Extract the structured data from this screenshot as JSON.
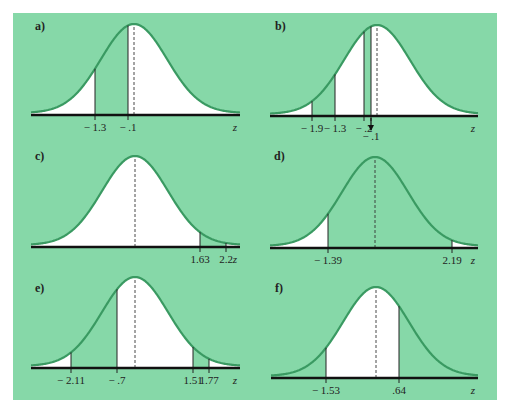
{
  "figure": {
    "background": "#86d8a8",
    "curve_color": "#3a9a62",
    "unshaded_color": "#ffffff",
    "axis_color": "#111111",
    "axis_variable": "z"
  },
  "chart_data": [
    {
      "type": "area",
      "label": "a)",
      "title": "Standard normal curve a)",
      "markers": [
        {
          "z": -1.3,
          "label": "− 1.3",
          "x": 95
        },
        {
          "z": -0.1,
          "label": "− .1",
          "x": 128
        }
      ],
      "green_regions": [
        [
          -1.3,
          -0.1
        ]
      ],
      "mean_x": 134,
      "axis_y": 115,
      "x_left": 31,
      "x_right": 240,
      "label_pos": [
        35,
        30
      ],
      "xlabel": "z"
    },
    {
      "type": "area",
      "label": "b)",
      "title": "Standard normal curve b)",
      "markers": [
        {
          "z": -1.9,
          "label": "− 1.9",
          "x": 312
        },
        {
          "z": -1.3,
          "label": "− 1.3",
          "x": 335
        },
        {
          "z": -0.2,
          "label": "− .2",
          "x": 364
        },
        {
          "z": -0.1,
          "label": "− .1",
          "x": 371,
          "arrow": true
        }
      ],
      "green_regions": [
        [
          -1.9,
          -1.3
        ],
        [
          -0.2,
          -0.1
        ]
      ],
      "mean_x": 377,
      "axis_y": 116,
      "x_left": 270,
      "x_right": 478,
      "label_pos": [
        275,
        30
      ],
      "xlabel": "z"
    },
    {
      "type": "area",
      "label": "c)",
      "title": "Standard normal curve c)",
      "markers": [
        {
          "z": 1.63,
          "label": "1.63",
          "x": 200
        },
        {
          "z": 2.2,
          "label": "2.2",
          "x": 226
        }
      ],
      "green_regions": [
        [
          1.63,
          2.2
        ]
      ],
      "mean_x": 135,
      "axis_y": 247,
      "x_left": 31,
      "x_right": 240,
      "label_pos": [
        35,
        160
      ],
      "xlabel": "z"
    },
    {
      "type": "area",
      "label": "d)",
      "title": "Standard normal curve d)",
      "markers": [
        {
          "z": -1.39,
          "label": "− 1.39",
          "x": 328
        },
        {
          "z": 2.19,
          "label": "2.19",
          "x": 452
        }
      ],
      "green_regions": [
        [
          -1.39,
          2.19
        ]
      ],
      "mean_x": 375,
      "axis_y": 248,
      "x_left": 270,
      "x_right": 478,
      "label_pos": [
        274,
        160
      ],
      "xlabel": "z"
    },
    {
      "type": "area",
      "label": "e)",
      "title": "Standard normal curve e)",
      "markers": [
        {
          "z": -2.11,
          "label": "− 2.11",
          "x": 71
        },
        {
          "z": -0.7,
          "label": "− .7",
          "x": 117
        },
        {
          "z": 1.51,
          "label": "1.51",
          "x": 193
        },
        {
          "z": 1.77,
          "label": "1.77",
          "x": 209
        }
      ],
      "green_regions": [
        [
          -2.11,
          -0.7
        ],
        [
          1.51,
          1.77
        ]
      ],
      "mean_x": 135,
      "axis_y": 368,
      "x_left": 31,
      "x_right": 240,
      "label_pos": [
        35,
        292
      ],
      "xlabel": "z"
    },
    {
      "type": "area",
      "label": "f)",
      "title": "Standard normal curve f)",
      "markers": [
        {
          "z": -1.53,
          "label": "− 1.53",
          "x": 326
        },
        {
          "z": 0.64,
          "label": ".64",
          "x": 399
        }
      ],
      "green_regions": [
        [
          -99,
          -1.53
        ],
        [
          0.64,
          99
        ]
      ],
      "mean_x": 376,
      "axis_y": 378,
      "x_left": 271,
      "x_right": 478,
      "label_pos": [
        275,
        292
      ],
      "xlabel": "z"
    }
  ]
}
